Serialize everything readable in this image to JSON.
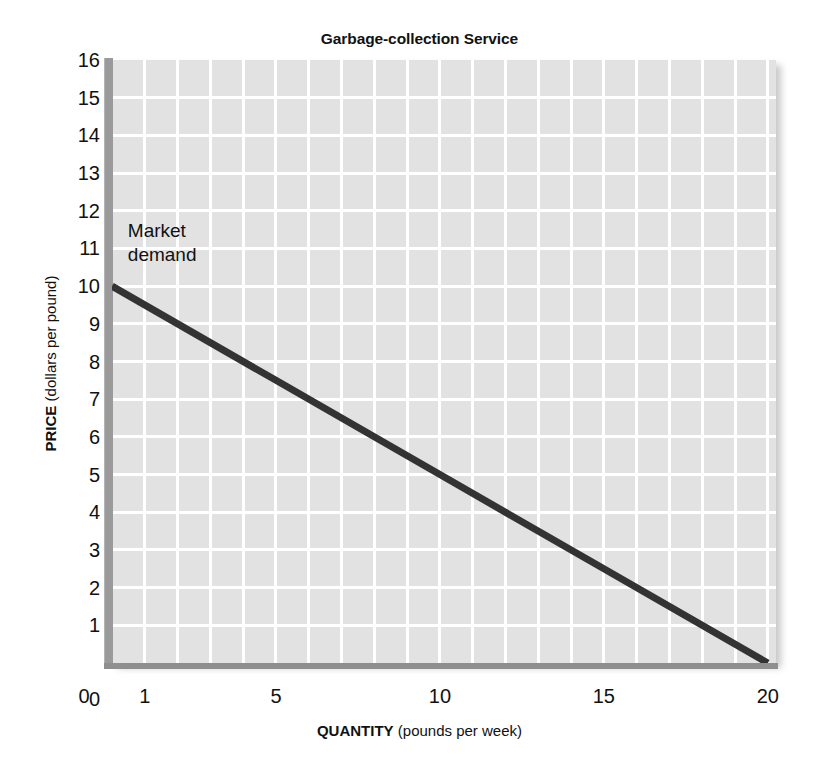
{
  "chart_data": {
    "type": "line",
    "title": "Garbage-collection Service",
    "xlabel_bold": "QUANTITY",
    "xlabel_rest": " (pounds per week)",
    "ylabel_bold": "PRICE",
    "ylabel_rest": " (dollars per pound)",
    "xlim": [
      0,
      20.25
    ],
    "ylim": [
      0,
      16
    ],
    "grid": true,
    "legend_position": "none",
    "x_ticks": [
      {
        "value": 0,
        "label": "0"
      },
      {
        "value": 1,
        "label": "1"
      },
      {
        "value": 5,
        "label": "5"
      },
      {
        "value": 10,
        "label": "10"
      },
      {
        "value": 15,
        "label": "15"
      },
      {
        "value": 20,
        "label": "20"
      }
    ],
    "y_ticks": [
      {
        "value": 16,
        "label": "16"
      },
      {
        "value": 15,
        "label": "15"
      },
      {
        "value": 14,
        "label": "14"
      },
      {
        "value": 13,
        "label": "13"
      },
      {
        "value": 12,
        "label": "12"
      },
      {
        "value": 11,
        "label": "11"
      },
      {
        "value": 10,
        "label": "10"
      },
      {
        "value": 9,
        "label": "9"
      },
      {
        "value": 8,
        "label": "8"
      },
      {
        "value": 7,
        "label": "7"
      },
      {
        "value": 6,
        "label": "6"
      },
      {
        "value": 5,
        "label": "5"
      },
      {
        "value": 4,
        "label": "4"
      },
      {
        "value": 3,
        "label": "3"
      },
      {
        "value": 2,
        "label": "2"
      },
      {
        "value": 1,
        "label": "1"
      },
      {
        "value": 0,
        "label": "0"
      }
    ],
    "gridlines": {
      "x_minor_step": 1,
      "y_minor_step": 1,
      "color": "#ffffff",
      "plot_background": "#e2e2e2"
    },
    "series": [
      {
        "name": "Market demand",
        "color": "#333333",
        "line_width": 7,
        "x": [
          0,
          20
        ],
        "values": [
          10,
          0
        ],
        "points": [
          {
            "x": 0,
            "y": 10
          },
          {
            "x": 5,
            "y": 7.5
          },
          {
            "x": 10,
            "y": 5
          },
          {
            "x": 15,
            "y": 2.5
          },
          {
            "x": 20,
            "y": 0
          }
        ]
      }
    ],
    "annotations": [
      {
        "id": "market-demand",
        "lines": [
          "Market",
          "demand"
        ],
        "x": 0.3,
        "y": 11.4
      }
    ]
  }
}
